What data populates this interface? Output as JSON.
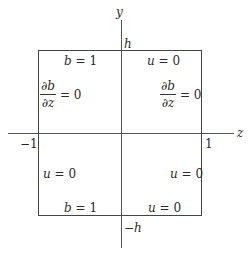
{
  "axes": {
    "vertical_label": "y",
    "horizontal_label": "z",
    "top_tick": "h",
    "bottom_tick": "−h",
    "left_tick": "−1",
    "right_tick": "1"
  },
  "boundary_conditions": {
    "top_left": {
      "var": "b",
      "eq": "= 1"
    },
    "top_right": {
      "var": "u",
      "eq": "= 0"
    },
    "left_upper": {
      "num": "∂b",
      "den": "∂z",
      "eq": "= 0"
    },
    "right_upper": {
      "num": "∂b",
      "den": "∂z",
      "eq": "= 0"
    },
    "left_lower": {
      "var": "u",
      "eq": "= 0"
    },
    "right_lower": {
      "var": "u",
      "eq": "= 0"
    },
    "bottom_left": {
      "var": "b",
      "eq": "= 1"
    },
    "bottom_right": {
      "var": "u",
      "eq": "= 0"
    }
  },
  "colors": {
    "lines": "#444444",
    "text": "#2a2a2a"
  }
}
